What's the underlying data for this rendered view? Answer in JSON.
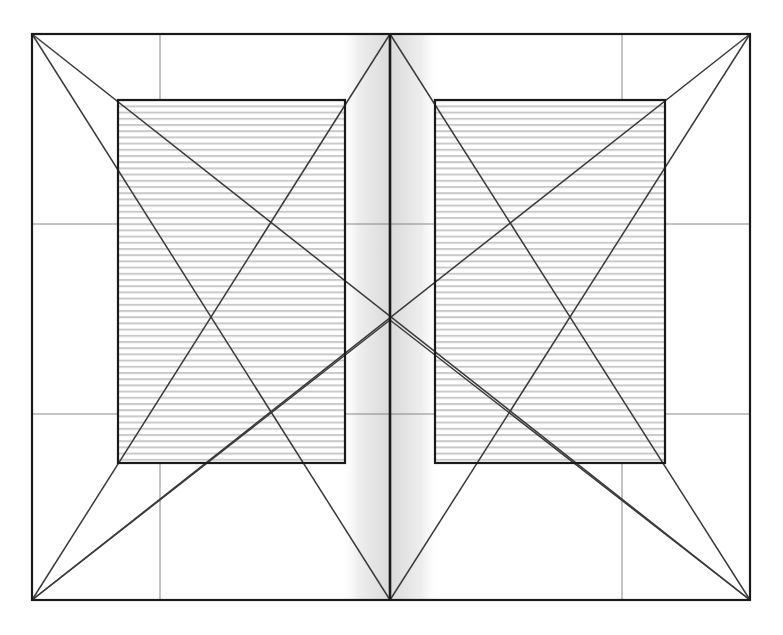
{
  "figure": {
    "kind": "van-de-graaf-canon-diagram",
    "title": "",
    "background_color": "#ffffff",
    "ink_color": "#1a1a1a",
    "grid_color": "#7a7a7a",
    "diagonal_color": "#3a3a3a",
    "hatch_color": "#c9c9c9",
    "gutter_shade_color": "#9a9a9a"
  },
  "page_spread": {
    "outer_frame": {
      "label": "page-spread-outer-frame",
      "x": 32,
      "y": 34,
      "width": 718,
      "height": 566,
      "stroke_width": 2.2
    },
    "spine": {
      "label": "center-spine",
      "x": 390,
      "y_top": 34,
      "y_bottom": 600,
      "stroke_width": 2.6
    },
    "gutter_shading": {
      "label": "gutter-gradient",
      "x": 340,
      "width": 100,
      "opacity": 0.55
    }
  },
  "construction_grid": {
    "vertical_lines": [
      {
        "name": "vertical-third-left",
        "x": 160
      },
      {
        "name": "vertical-third-right",
        "x": 622
      }
    ],
    "horizontal_lines": [
      {
        "name": "horizontal-upper",
        "y": 224
      },
      {
        "name": "horizontal-lower",
        "y": 414
      }
    ],
    "stroke_width": 0.9
  },
  "text_blocks": [
    {
      "name": "left-text-block",
      "side": "verso",
      "x": 118,
      "y": 100,
      "width": 227,
      "height": 363,
      "stroke_width": 2.2,
      "hatch_spacing": 6.2,
      "hatch_stroke": 2.0
    },
    {
      "name": "right-text-block",
      "side": "recto",
      "x": 435,
      "y": 100,
      "width": 230,
      "height": 363,
      "stroke_width": 2.2,
      "hatch_spacing": 6.2,
      "hatch_stroke": 2.0
    }
  ],
  "diagonals": {
    "stroke_width": 1.5,
    "lines": [
      {
        "name": "verso-page-diagonal-tl-br",
        "x1": 32,
        "y1": 34,
        "x2": 390,
        "y2": 600
      },
      {
        "name": "verso-page-diagonal-bl-tr",
        "x1": 32,
        "y1": 600,
        "x2": 390,
        "y2": 34
      },
      {
        "name": "recto-page-diagonal-tl-br",
        "x1": 390,
        "y1": 34,
        "x2": 750,
        "y2": 600
      },
      {
        "name": "recto-page-diagonal-bl-tr",
        "x1": 390,
        "y1": 600,
        "x2": 750,
        "y2": 34
      },
      {
        "name": "spread-diagonal-tl-br",
        "x1": 32,
        "y1": 34,
        "x2": 750,
        "y2": 600
      },
      {
        "name": "spread-diagonal-bl-tr",
        "x1": 32,
        "y1": 600,
        "x2": 750,
        "y2": 34
      },
      {
        "name": "verso-half-diagonal-upper",
        "x1": 32,
        "y1": 600,
        "x2": 390,
        "y2": 320
      },
      {
        "name": "recto-half-diagonal-upper",
        "x1": 750,
        "y1": 600,
        "x2": 390,
        "y2": 320
      }
    ]
  },
  "key_intersections": [
    {
      "name": "spine-center-crossing",
      "x": 392,
      "y": 320
    },
    {
      "name": "verso-block-inner-corner",
      "x": 345,
      "y": 463
    },
    {
      "name": "recto-block-inner-corner",
      "x": 435,
      "y": 463
    }
  ]
}
